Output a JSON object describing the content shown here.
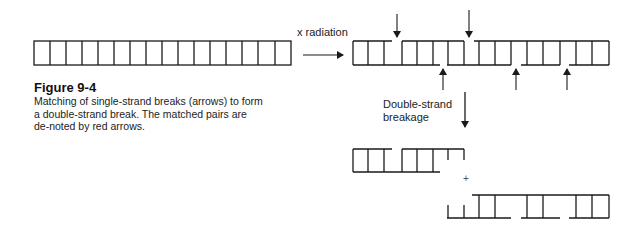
{
  "figure": {
    "title": "Figure 9-4",
    "caption": "Matching of single-strand breaks (arrows) to form a double-strand break. The matched pairs are de-noted by red arrows."
  },
  "labels": {
    "radiation": "x radiation",
    "breakage_line1": "Double-strand",
    "breakage_line2": "breakage",
    "plus": "+"
  },
  "diagram": {
    "intact_dna": {
      "cells": 16
    },
    "irradiated_dna": {
      "top_strand_breaks": 2,
      "bottom_strand_breaks": 3
    },
    "colors": {
      "line": "#1a1a1a",
      "background": "#ffffff"
    }
  }
}
